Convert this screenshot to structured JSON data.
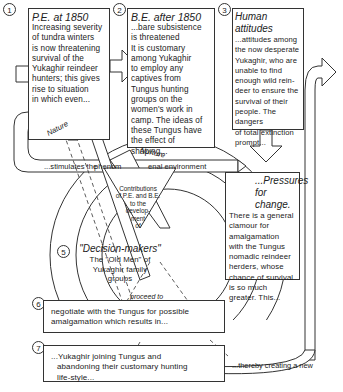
{
  "boxes": [
    {
      "number": "1",
      "title": "P.E. at 1850",
      "lines": [
        "Increasing severity",
        "of tundra winters",
        "is now threatening",
        "survival of the",
        "Yukaghir reindeer",
        "hunters; this gives",
        "rise to situation",
        "in which even..."
      ]
    },
    {
      "number": "2",
      "title": "B.E. after 1850",
      "lines": [
        "...bare subsistence",
        "is threatened",
        "It is customary",
        "among Yukaghir",
        "to employ any",
        "captives from",
        "Tungus hunting",
        "groups on the",
        "women's work in",
        "camp. The ideas of",
        "these Tungus have",
        "the effect of",
        "shaping..."
      ]
    },
    {
      "number": "3",
      "title": "Human attitudes",
      "lines": [
        "...attitudes among",
        "the now desperate",
        "Yukaghir, who are",
        "unable to find",
        "enough wild rein-",
        "deer to ensure the",
        "survival of their",
        "people. The dangers",
        "of total extinction",
        "prompt..."
      ]
    },
    {
      "number": "4",
      "title": "...Pressures for change.",
      "lines": [
        "There is a general",
        "clamour for",
        "amalgamation",
        "with the Tungus",
        "nomadic reindeer",
        "herders, whose",
        "chance of survival",
        "is so much",
        "greater. This..."
      ]
    },
    {
      "number": "5",
      "title": "\"Decision-makers\"",
      "lines": [
        "The \"Old Men\" of",
        "Yukaghir family",
        "groups"
      ]
    },
    {
      "number": "6",
      "lines": [
        "negotiate with the Tungus for possible",
        "amalgamation which results in..."
      ]
    },
    {
      "number": "7",
      "lines": [
        "...Yukaghir joining Tungus and",
        "abandoning their customary hunting",
        "life-style..."
      ]
    }
  ],
  "labels": {
    "nature": "Nature",
    "nurture": "Nurture",
    "stimulates": "...stimulates the",
    "phenom": "phenom",
    "enal_env": "enal environment",
    "contributions": [
      "Contributions",
      "of P.E. and B.E.",
      "to the",
      "develop-",
      "ment",
      "of"
    ],
    "proceed_to": "proceed to",
    "thereby": "...thereby creating a new"
  }
}
